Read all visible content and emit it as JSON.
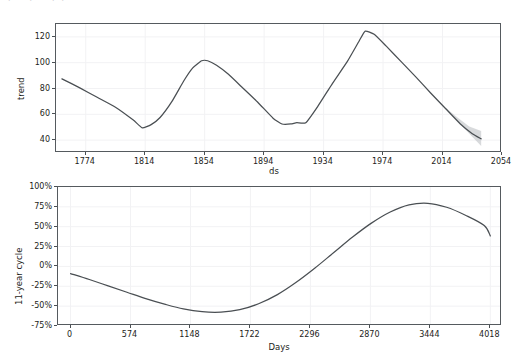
{
  "figure": {
    "title_fragment": "ple, pr    mp    p",
    "background_color": "#ffffff",
    "line_color": "#4a4f53",
    "uncertainty_color": "#b8bcc0",
    "grid_color": "#f2f2f4",
    "axis_color": "#555a5e"
  },
  "chart_data": [
    {
      "type": "line",
      "name": "trend-panel",
      "title": "",
      "xlabel": "ds",
      "ylabel": "trend",
      "xlim": [
        1754,
        2054
      ],
      "ylim": [
        30,
        130
      ],
      "xticks": [
        1774,
        1814,
        1854,
        1894,
        1934,
        1974,
        2014,
        2054
      ],
      "yticks": [
        40,
        60,
        80,
        100,
        120
      ],
      "grid": true,
      "legend": "none",
      "x": [
        1758,
        1770,
        1782,
        1794,
        1806,
        1812,
        1818,
        1824,
        1832,
        1840,
        1846,
        1852,
        1856,
        1862,
        1870,
        1880,
        1890,
        1900,
        1906,
        1912,
        1916,
        1922,
        1930,
        1940,
        1950,
        1958,
        1962,
        1968,
        1976,
        1986,
        1996,
        2006,
        2016,
        2026,
        2034,
        2040
      ],
      "y": [
        87.5,
        80.5,
        73.0,
        65.5,
        55.5,
        49.5,
        52.0,
        57.5,
        70.0,
        86.0,
        96.0,
        101.5,
        101.5,
        98.0,
        91.0,
        80.0,
        69.0,
        57.0,
        52.5,
        52.5,
        53.5,
        53.5,
        66.0,
        84.0,
        101.0,
        117.0,
        124.5,
        122.0,
        113.0,
        101.0,
        89.0,
        76.5,
        64.5,
        52.5,
        45.0,
        41.0
      ],
      "uncertainty": {
        "x": [
          2016,
          2024,
          2032,
          2040
        ],
        "lower": [
          64.0,
          55.0,
          45.0,
          35.5
        ],
        "upper": [
          65.0,
          57.5,
          50.5,
          47.0
        ]
      }
    },
    {
      "type": "line",
      "name": "eleven-year-cycle-panel",
      "title": "",
      "xlabel": "Days",
      "ylabel": "11-year cycle",
      "xlim": [
        -120,
        4130
      ],
      "ylim": [
        -0.75,
        1.0
      ],
      "xticks": [
        0,
        574,
        1148,
        1722,
        2296,
        2870,
        3444,
        4018
      ],
      "xtick_labels": [
        "0",
        "574",
        "1148",
        "1722",
        "2296",
        "2870",
        "3444",
        "4018"
      ],
      "yticks": [
        -0.75,
        -0.5,
        -0.25,
        0,
        0.25,
        0.5,
        0.75,
        1.0
      ],
      "ytick_labels": [
        "-75%",
        "-50%",
        "-25%",
        "0%",
        "25%",
        "50%",
        "75%",
        "100%"
      ],
      "grid": true,
      "legend": "none",
      "x": [
        0,
        180,
        360,
        540,
        720,
        900,
        1080,
        1260,
        1440,
        1620,
        1800,
        1980,
        2160,
        2340,
        2520,
        2700,
        2880,
        3060,
        3240,
        3420,
        3600,
        3780,
        3960,
        4018
      ],
      "y": [
        -0.09,
        -0.165,
        -0.245,
        -0.325,
        -0.405,
        -0.475,
        -0.535,
        -0.57,
        -0.575,
        -0.545,
        -0.47,
        -0.355,
        -0.2,
        -0.02,
        0.175,
        0.37,
        0.545,
        0.685,
        0.775,
        0.795,
        0.745,
        0.645,
        0.515,
        0.385
      ]
    }
  ]
}
